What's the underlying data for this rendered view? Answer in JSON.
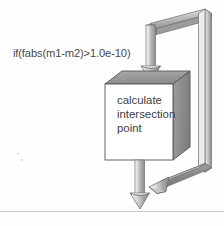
{
  "figure": {
    "type": "flowchart-3d",
    "title": "",
    "condition_label": "if(fabs(m1-m2)>1.0e-10)",
    "process_box": {
      "lines": [
        "calculate",
        "intersection",
        "point"
      ],
      "face_color": "#ffffff",
      "top_color": "#9a9a9a",
      "side_color": "#8e8e8e",
      "outline_color": "#555555"
    },
    "connectors": [
      {
        "name": "incoming-down-arrow",
        "direction": "down",
        "arrowhead": "filled-cone",
        "color": "#b0b0b0"
      },
      {
        "name": "loopback-top-band",
        "direction": "diagonal-up-right",
        "arrowhead": "none",
        "color": "#a8a8a8"
      },
      {
        "name": "loopback-right-band",
        "direction": "vertical",
        "arrowhead": "none",
        "color": "#a0a0a0"
      },
      {
        "name": "loopback-bottom-band",
        "direction": "diagonal-down-left",
        "arrowhead": "filled-cone",
        "color": "#8a8a8a"
      },
      {
        "name": "outgoing-down-arrow",
        "direction": "down",
        "arrowhead": "filled-cone",
        "color": "#b4b4b4"
      }
    ],
    "divider_line": true,
    "background_color": "#fefefe",
    "ink_color": "#4a4a4a"
  }
}
